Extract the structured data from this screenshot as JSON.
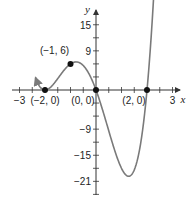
{
  "chart_data": {
    "type": "line",
    "title": "",
    "xlabel": "x",
    "ylabel": "y",
    "xlim": [
      -3.3,
      3.3
    ],
    "ylim": [
      -24,
      19
    ],
    "grid": false,
    "function": "y = 2x(x+2)^2(x-2)",
    "x_ticks": [
      -3,
      -2.5,
      -2,
      -1.5,
      -1,
      -0.5,
      0.5,
      1,
      1.5,
      2,
      2.5,
      3
    ],
    "x_tick_labels": [
      {
        "x": -3,
        "label": "−3"
      },
      {
        "x": 3,
        "label": "3"
      }
    ],
    "y_ticks": [
      18,
      15,
      12,
      9,
      6,
      3,
      -3,
      -6,
      -9,
      -12,
      -15,
      -18,
      -21,
      -24
    ],
    "y_tick_labels": [
      {
        "y": 15,
        "label": "15"
      },
      {
        "y": 9,
        "label": "9"
      },
      {
        "y": -9,
        "label": "−9"
      },
      {
        "y": -15,
        "label": "−15"
      },
      {
        "y": -21,
        "label": "−21"
      }
    ],
    "series": [
      {
        "name": "f(x)",
        "color": "#7a7a7a",
        "x": [
          -2.37,
          -2.3,
          -2.2,
          -2.1,
          -2.0,
          -1.9,
          -1.8,
          -1.6,
          -1.4,
          -1.2,
          -1.0,
          -0.8,
          -0.6,
          -0.4,
          -0.2,
          0.0,
          0.2,
          0.4,
          0.6,
          0.8,
          1.0,
          1.2,
          1.4,
          1.6,
          1.8,
          2.0,
          2.1,
          2.2,
          2.3,
          2.38
        ],
        "values": [
          16.6,
          11.6,
          6.8,
          2.5,
          0.0,
          -1.0,
          0.5,
          4.2,
          5.6,
          6.8,
          6.0,
          5.5,
          4.2,
          2.5,
          0.9,
          0.0,
          -3.1,
          -6.5,
          -11.5,
          -15.8,
          -18.0,
          -19.7,
          -19.0,
          -15.9,
          -9.3,
          0.0,
          7.1,
          15.0,
          20.0,
          26.0
        ]
      }
    ],
    "annotations": [
      {
        "x": -1,
        "y": 6,
        "label": "(−1, 6)",
        "marker": true
      },
      {
        "x": -2,
        "y": 0,
        "label": "(−2, 0)",
        "marker": true
      },
      {
        "x": 0,
        "y": 0,
        "label": "(0, 0)",
        "marker": true
      },
      {
        "x": 2,
        "y": 0,
        "label": "(2, 0)",
        "marker": true
      }
    ]
  }
}
